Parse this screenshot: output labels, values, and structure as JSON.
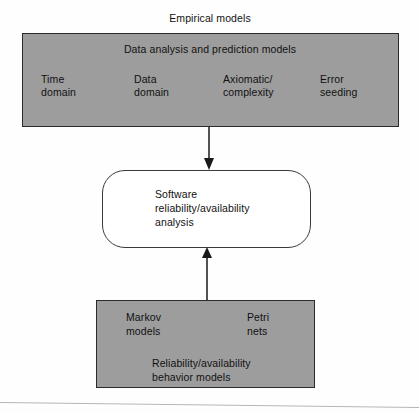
{
  "diagram": {
    "caption": "Empirical models",
    "top_box": {
      "heading": "Data analysis and prediction models",
      "columns": [
        {
          "line1": "Time",
          "line2": "domain"
        },
        {
          "line1": "Data",
          "line2": "domain"
        },
        {
          "line1": "Axiomatic/",
          "line2": "complexity"
        },
        {
          "line1": "Error",
          "line2": "seeding"
        }
      ]
    },
    "center_box": {
      "line1": "Software",
      "line2": "reliability/availability",
      "line3": "analysis"
    },
    "bottom_box": {
      "left": {
        "line1": "Markov",
        "line2": "models"
      },
      "right": {
        "line1": "Petri",
        "line2": "nets"
      },
      "footer": {
        "line1": "Reliability/availability",
        "line2": "behavior models"
      }
    },
    "arrows": [
      {
        "name": "arrow-top-to-center",
        "direction": "down"
      },
      {
        "name": "arrow-bottom-to-center",
        "direction": "up"
      }
    ],
    "colors": {
      "box_fill": "#9d9d9d",
      "box_border": "#2b2b2b",
      "center_fill": "#ffffff",
      "center_border": "#3a3a3a",
      "text": "#111111",
      "arrow": "#1a1a1a"
    }
  }
}
